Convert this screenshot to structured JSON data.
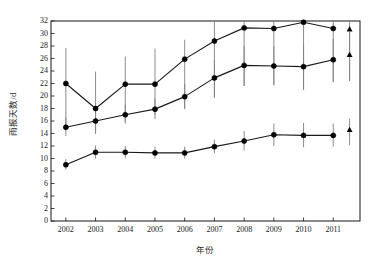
{
  "chart_data": {
    "type": "line",
    "title": "",
    "xlabel": "年份",
    "ylabel": "雨报天数/d",
    "categories": [
      "2002",
      "2003",
      "2004",
      "2005",
      "2006",
      "2007",
      "2008",
      "2009",
      "2010",
      "2011"
    ],
    "x": [
      2002,
      2003,
      2004,
      2005,
      2006,
      2007,
      2008,
      2009,
      2010,
      2011
    ],
    "xlim": [
      2001.5,
      2011.9
    ],
    "ylim": [
      0,
      32
    ],
    "yticks": [
      0,
      2,
      4,
      6,
      8,
      10,
      12,
      14,
      16,
      18,
      20,
      22,
      24,
      26,
      28,
      30,
      32
    ],
    "grid": false,
    "legend": "none",
    "marker": "circle",
    "errorbars": true,
    "series": [
      {
        "name": "series-upper",
        "marker": "circle",
        "values": [
          22.0,
          18.0,
          21.9,
          21.9,
          25.9,
          28.8,
          30.9,
          30.8,
          31.8,
          30.8
        ],
        "err_low": [
          15.0,
          13.9,
          15.9,
          16.9,
          17.9,
          19.7,
          21.6,
          21.8,
          21.0,
          22.2
        ],
        "err_high": [
          27.7,
          23.9,
          26.3,
          27.6,
          29.0,
          32.0,
          32.0,
          32.0,
          32.0,
          32.0
        ]
      },
      {
        "name": "series-middle",
        "marker": "circle",
        "values": [
          15.0,
          16.0,
          17.0,
          17.9,
          19.9,
          22.9,
          24.9,
          24.8,
          24.7,
          25.8
        ],
        "err_low": [
          13.6,
          14.4,
          15.6,
          16.3,
          18.0,
          19.8,
          21.6,
          21.7,
          21.0,
          22.3
        ],
        "err_high": [
          16.6,
          17.7,
          18.6,
          19.6,
          21.9,
          25.8,
          28.0,
          28.0,
          28.2,
          29.1
        ]
      },
      {
        "name": "series-lower",
        "marker": "circle",
        "values": [
          9.0,
          11.0,
          11.0,
          10.9,
          10.9,
          11.9,
          12.8,
          13.8,
          13.7,
          13.7
        ],
        "err_low": [
          8.2,
          10.0,
          10.0,
          10.0,
          10.0,
          10.8,
          11.3,
          12.0,
          11.8,
          11.9
        ],
        "err_high": [
          9.9,
          12.1,
          12.0,
          11.9,
          11.9,
          13.0,
          14.4,
          15.6,
          15.7,
          15.6
        ]
      }
    ],
    "extra_markers": {
      "name": "mean-triangles",
      "marker": "triangle",
      "x": 2011.55,
      "values": [
        30.7,
        26.6,
        14.6
      ],
      "err_low": [
        22.5,
        22.4,
        12.1
      ],
      "err_high": [
        32.0,
        30.4,
        16.4
      ]
    },
    "colors": {
      "line": "#1a1a1a",
      "marker": "#000000",
      "errorbar": "#808080",
      "axis": "#2b2b2b",
      "background": "#ffffff"
    }
  }
}
